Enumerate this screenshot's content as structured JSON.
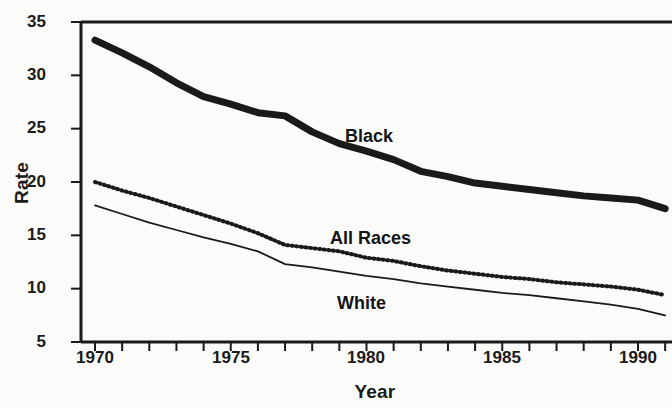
{
  "chart_data": {
    "type": "line",
    "title": "",
    "subtitle": "",
    "xlabel": "Year",
    "ylabel": "Rate",
    "xlim": [
      1970,
      1991
    ],
    "ylim": [
      5,
      35
    ],
    "y_ticks": [
      5,
      10,
      15,
      20,
      25,
      30,
      35
    ],
    "y_tick_labels": [
      "5",
      "10",
      "15",
      "20",
      "25",
      "30",
      "35"
    ],
    "x_ticks": [
      1970,
      1971,
      1972,
      1973,
      1974,
      1975,
      1976,
      1977,
      1978,
      1979,
      1980,
      1981,
      1982,
      1983,
      1984,
      1985,
      1986,
      1987,
      1988,
      1989,
      1990,
      1991
    ],
    "x_tick_labels_shown": [
      "1970",
      "1975",
      "1980",
      "1985",
      "1990"
    ],
    "x_tick_labels_shown_values": [
      1970,
      1975,
      1980,
      1985,
      1990
    ],
    "grid": false,
    "legend": "inline-labels",
    "legend_position": "inline",
    "x": [
      1970,
      1971,
      1972,
      1973,
      1974,
      1975,
      1976,
      1977,
      1978,
      1979,
      1980,
      1981,
      1982,
      1983,
      1984,
      1985,
      1986,
      1987,
      1988,
      1989,
      1990,
      1991
    ],
    "series": [
      {
        "name": "Black",
        "style": "thick-solid",
        "color": "#1a1a1a",
        "label_text": "Black",
        "values": [
          33.3,
          32.1,
          30.8,
          29.3,
          28.0,
          27.3,
          26.5,
          26.2,
          24.7,
          23.6,
          22.9,
          22.1,
          21.0,
          20.5,
          19.9,
          19.6,
          19.3,
          19.0,
          18.7,
          18.5,
          18.3,
          17.5
        ]
      },
      {
        "name": "All Races",
        "style": "dotted",
        "color": "#1a1a1a",
        "label_text": "All Races",
        "values": [
          20.0,
          19.2,
          18.5,
          17.7,
          16.9,
          16.1,
          15.2,
          14.1,
          13.8,
          13.5,
          12.9,
          12.6,
          12.1,
          11.7,
          11.4,
          11.1,
          10.9,
          10.6,
          10.4,
          10.2,
          9.9,
          9.4
        ]
      },
      {
        "name": "White",
        "style": "thin-solid",
        "color": "#1a1a1a",
        "label_text": "White",
        "values": [
          17.8,
          17.0,
          16.2,
          15.5,
          14.8,
          14.2,
          13.5,
          12.3,
          12.0,
          11.6,
          11.2,
          10.9,
          10.5,
          10.2,
          9.9,
          9.6,
          9.4,
          9.1,
          8.8,
          8.5,
          8.1,
          7.5
        ]
      }
    ]
  },
  "axes": {
    "y_title": "Rate",
    "x_title": "Year"
  },
  "labels": {
    "black": "Black",
    "all_races": "All Races",
    "white": "White"
  }
}
